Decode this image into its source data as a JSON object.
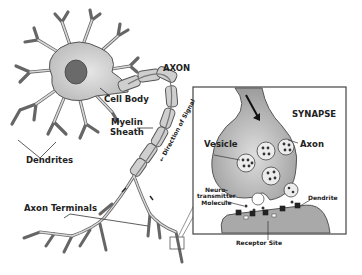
{
  "diagram": {
    "colors": {
      "cell_fill": "#c8c8c8",
      "nucleus": "#6a6a6a",
      "myelin_fill": "#cfcfcf",
      "outline": "#555555",
      "synapse_fill": "#a9a9a9",
      "box_border": "#444444",
      "text": "#222222"
    },
    "labels": {
      "axon": "AXON",
      "cell_body": "Cell Body",
      "myelin_line1": "Myelin",
      "myelin_line2": "Sheath",
      "direction": "Direction of Signal",
      "dendrites": "Dendrites",
      "axon_terminals": "Axon Terminals"
    },
    "inset": {
      "title": "SYNAPSE",
      "vesicle": "Vesicle",
      "axon": "Axon",
      "nt_line1": "Neuro-",
      "nt_line2": "transmitter",
      "nt_line3": "Molecule",
      "dendrite": "Dendrite",
      "receptor_site": "Receptor Site"
    }
  }
}
